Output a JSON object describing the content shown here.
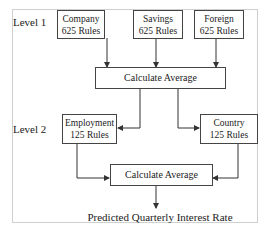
{
  "diagram": {
    "levels": [
      {
        "label": "Level 1"
      },
      {
        "label": "Level 2"
      }
    ],
    "level1_boxes": [
      {
        "name": "Company",
        "rules": "625 Rules"
      },
      {
        "name": "Savings",
        "rules": "625 Rules"
      },
      {
        "name": "Foreign",
        "rules": "625 Rules"
      }
    ],
    "aggregator1": {
      "label": "Calculate Average"
    },
    "level2_boxes": [
      {
        "name": "Employment",
        "rules": "125 Rules"
      },
      {
        "name": "Country",
        "rules": "125 Rules"
      }
    ],
    "aggregator2": {
      "label": "Calculate Average"
    },
    "output": {
      "label": "Predicted Quarterly Interest Rate"
    },
    "colors": {
      "line": "#333333",
      "frame": "#cfcfcf",
      "text": "#222222"
    }
  }
}
